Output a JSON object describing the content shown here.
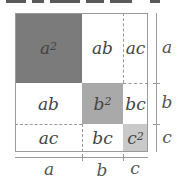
{
  "diagram": {
    "colors": {
      "a_squared": "#7b7b7b",
      "b_squared": "#a9a9a9",
      "c_squared": "#c9c9c9",
      "cross_terms": "#ffffff",
      "border": "#9a9a9a"
    },
    "cells": {
      "r1c1": {
        "base": "a",
        "exp": "2"
      },
      "r1c2": {
        "text": "ab"
      },
      "r1c3": {
        "text": "ac"
      },
      "r2c1": {
        "text": "ab"
      },
      "r2c2": {
        "base": "b",
        "exp": "2"
      },
      "r2c3": {
        "text": "bc"
      },
      "r3c1": {
        "text": "ac"
      },
      "r3c2": {
        "text": "bc"
      },
      "r3c3": {
        "base": "c",
        "exp": "2"
      }
    },
    "side_labels": {
      "right": [
        "a",
        "b",
        "c"
      ],
      "bottom": [
        "a",
        "b",
        "c"
      ]
    }
  }
}
